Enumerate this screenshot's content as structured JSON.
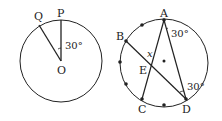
{
  "left_figure": {
    "labels": {
      "Q": "Q",
      "P": "P",
      "O": "O",
      "angle": "30°"
    }
  },
  "right_figure": {
    "labels": {
      "A": "A",
      "B": "B",
      "C": "C",
      "D": "D",
      "E": "E",
      "x": "x",
      "angle_A": "30°",
      "angle_D": "30°"
    }
  }
}
